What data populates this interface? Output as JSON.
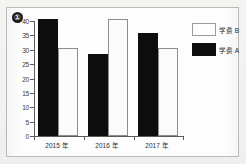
{
  "badge": {
    "label": "①"
  },
  "legend": {
    "position": "top-right",
    "entries": [
      {
        "key": "b",
        "label": "学费 B",
        "swatch": "white-swatch-icon",
        "color": "#fdfdfd"
      },
      {
        "key": "a",
        "label": "学费 A",
        "swatch": "black-swatch-icon",
        "color": "#0d0d0d"
      }
    ]
  },
  "chart_data": {
    "type": "bar",
    "title": "",
    "xlabel": "",
    "ylabel": "",
    "categories": [
      "2015 年",
      "2016 年",
      "2017 年"
    ],
    "series": [
      {
        "name": "学费 A",
        "values": [
          40,
          28,
          35
        ],
        "color": "#0d0d0d"
      },
      {
        "name": "学费 B",
        "values": [
          30,
          40,
          30
        ],
        "color": "#fdfdfd"
      }
    ],
    "ylim": [
      0,
      40
    ],
    "ytick_values": [
      0,
      5,
      10,
      15,
      20,
      25,
      30,
      35,
      40
    ],
    "ytick_labels": [
      "0",
      "5",
      "10",
      "15",
      "20",
      "25",
      "30",
      "35",
      "40"
    ],
    "grid": false,
    "legend_position": "top-right"
  }
}
